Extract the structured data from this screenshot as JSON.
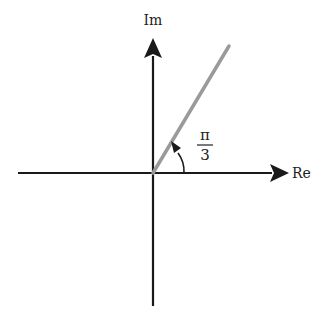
{
  "diagram": {
    "type": "complex-plane-angle",
    "axes": {
      "horizontal_label": "Re",
      "vertical_label": "Im",
      "color": "#1a1a1a"
    },
    "ray": {
      "angle_label_numerator": "π",
      "angle_label_denominator": "3",
      "angle_radians": "π/3",
      "color": "#9a9a9a"
    }
  }
}
